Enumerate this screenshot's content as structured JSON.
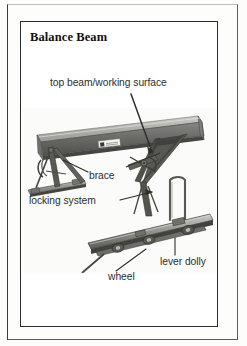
{
  "figure": {
    "title": "Balance Beam",
    "kind": "labeled-photograph"
  },
  "labels": [
    {
      "id": "top-beam",
      "text": "top beam/working surface"
    },
    {
      "id": "brace",
      "text": "brace"
    },
    {
      "id": "locking-system",
      "text": "locking system"
    },
    {
      "id": "wheel",
      "text": "wheel"
    },
    {
      "id": "lever-dolly",
      "text": "lever dolly"
    }
  ],
  "colors": {
    "ink": "#2b2b2a",
    "title_ink": "#111110",
    "label_ink": "#2e2e2c",
    "rule": "#3a3a38",
    "paper": "#ffffff",
    "photo_dark": "#3b3b39",
    "photo_mid": "#8d8d88",
    "photo_light": "#c9c9c4"
  },
  "photo": {
    "subject": "balance beam concrete forming beam on folding legs with lever dolly",
    "parts": [
      "top beam",
      "left folding A-frame leg",
      "base rail",
      "diagonal brace",
      "locking system",
      "right folding leg",
      "lever dolly rail",
      "wheels",
      "beam identification plate"
    ]
  }
}
